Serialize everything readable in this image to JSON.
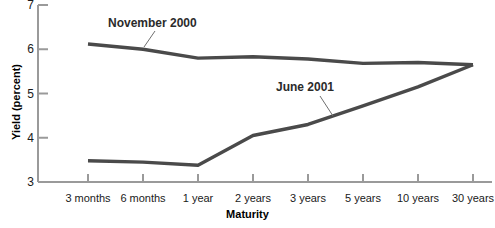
{
  "chart_data": {
    "type": "line",
    "title": "",
    "xlabel": "Maturity",
    "ylabel": "Yield (percent)",
    "categories": [
      "3 months",
      "6 months",
      "1 year",
      "2 years",
      "3 years",
      "5 years",
      "10 years",
      "30 years"
    ],
    "ylim": [
      3,
      7
    ],
    "yticks": [
      3,
      4,
      5,
      6,
      7
    ],
    "grid": false,
    "legend_position": "inline-annotations",
    "series": [
      {
        "name": "November 2000",
        "values": [
          6.12,
          6.0,
          5.8,
          5.83,
          5.78,
          5.68,
          5.7,
          5.65
        ],
        "color": "#4a4a4a",
        "annotation": {
          "label": "November 2000",
          "x": 108,
          "y": 16,
          "leader": {
            "x1": 155,
            "y1": 31,
            "x2": 144,
            "y2": 47
          }
        }
      },
      {
        "name": "June 2001",
        "values": [
          3.48,
          3.45,
          3.38,
          4.05,
          4.3,
          4.72,
          5.15,
          5.65
        ],
        "color": "#4a4a4a",
        "annotation": {
          "label": "June 2001",
          "x": 276,
          "y": 80,
          "leader": {
            "x1": 320,
            "y1": 96,
            "x2": 333,
            "y2": 116
          }
        }
      }
    ]
  },
  "axes": {
    "y_title": "Yield (percent)",
    "x_title": "Maturity",
    "y_tick_labels": [
      "7",
      "6",
      "5",
      "4",
      "3"
    ],
    "x_tick_labels": [
      "3 months",
      "6 months",
      "1 year",
      "2 years",
      "3 years",
      "5 years",
      "10 years",
      "30 years"
    ]
  },
  "colors": {
    "series_line": "#4a4a4a",
    "axis": "#9a9a9a",
    "text": "#1a1a1a",
    "background": "#ffffff"
  }
}
